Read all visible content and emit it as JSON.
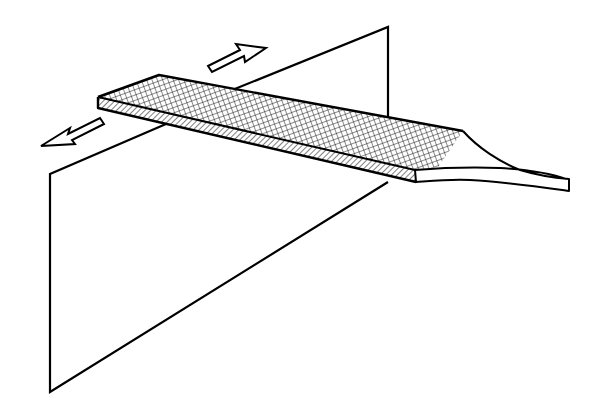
{
  "diagram": {
    "description": "Flat file tool passing through a plane with bidirectional motion arrows",
    "elements": {
      "plane": "vertical-plane",
      "file_body": "crosshatched-file-blade",
      "file_side": "diagonal-hatched-edge",
      "tang": "tapered-handle-tang",
      "arrow_forward": "push-arrow",
      "arrow_back": "pull-arrow"
    },
    "colors": {
      "stroke": "#000000",
      "background": "#ffffff"
    }
  }
}
